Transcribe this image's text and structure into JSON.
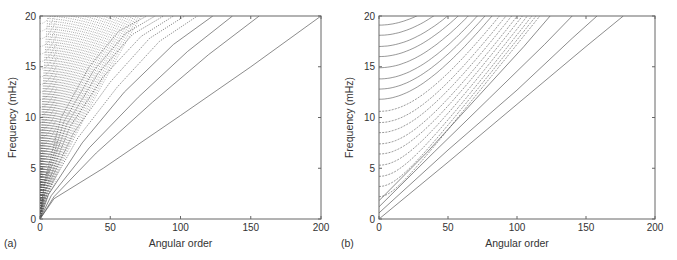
{
  "chart_data": [
    {
      "panel": "(a)",
      "type": "line",
      "title": "",
      "xlabel": "Angular order",
      "ylabel": "Frequency (mHz)",
      "xlim": [
        0,
        200
      ],
      "ylim": [
        0,
        20
      ],
      "xticks": [
        0,
        50,
        100,
        150,
        200
      ],
      "yticks": [
        0,
        5,
        10,
        15,
        20
      ],
      "grid": false,
      "legend": null,
      "description": "Dispersion branches (frequency vs angular order) for a spherical model; dense dotted branches fan out from the origin, fundamental branch reaches (200, 20)",
      "series": [
        {
          "name": "branch-0",
          "x": [
            0,
            10,
            45,
            100,
            150,
            200
          ],
          "y": [
            0,
            2,
            5,
            10.2,
            15,
            20
          ]
        },
        {
          "name": "branch-1",
          "x": [
            0,
            10,
            40,
            80,
            120,
            156
          ],
          "y": [
            0,
            2.2,
            6.5,
            11.5,
            16.2,
            20
          ]
        },
        {
          "name": "branch-2",
          "x": [
            0,
            8,
            35,
            70,
            105,
            137
          ],
          "y": [
            0,
            2.3,
            7,
            12,
            16.5,
            20
          ]
        },
        {
          "name": "branch-3",
          "x": [
            0,
            6,
            30,
            60,
            95,
            123
          ],
          "y": [
            0,
            2.4,
            7.5,
            12.5,
            17.2,
            20
          ]
        },
        {
          "name": "branch-4",
          "x": [
            0,
            5,
            27,
            55,
            85,
            112
          ],
          "y": [
            0,
            2.6,
            8,
            13,
            17.5,
            20
          ]
        },
        {
          "name": "branch-5",
          "x": [
            0,
            4,
            24,
            50,
            78,
            103
          ],
          "y": [
            0,
            2.8,
            8.5,
            13.5,
            17.8,
            20
          ]
        },
        {
          "name": "branch-6",
          "x": [
            0,
            4,
            21,
            45,
            72,
            95
          ],
          "y": [
            0,
            3,
            9,
            14,
            18,
            20
          ]
        },
        {
          "name": "branch-7",
          "x": [
            0,
            3,
            19,
            41,
            66,
            88
          ],
          "y": [
            0,
            3.2,
            9.3,
            14.3,
            18.2,
            20
          ]
        },
        {
          "name": "branch-8",
          "x": [
            0,
            3,
            17,
            38,
            61,
            82
          ],
          "y": [
            0,
            3.4,
            9.6,
            14.6,
            18.3,
            20
          ]
        },
        {
          "name": "branch-9",
          "x": [
            0,
            3,
            15,
            35,
            56,
            76
          ],
          "y": [
            0,
            3.6,
            10,
            15,
            18.5,
            20
          ]
        }
      ]
    },
    {
      "panel": "(b)",
      "type": "line",
      "title": "",
      "xlabel": "Angular order",
      "ylabel": "Frequency (mHz)",
      "xlim": [
        0,
        200
      ],
      "ylim": [
        0,
        20
      ],
      "xticks": [
        0,
        50,
        100,
        150,
        200
      ],
      "yticks": [
        0,
        5,
        10,
        15,
        20
      ],
      "grid": false,
      "legend": null,
      "description": "Dispersion branches for a simplified model; overtone branches start at ~1 mHz spacing on the frequency axis and curve upward to the right; fundamental branch reaches ~(177, 20)",
      "series": [
        {
          "name": "branch-0",
          "x": [
            0,
            50,
            100,
            150,
            177
          ],
          "y": [
            0,
            5.6,
            11.3,
            17,
            20
          ]
        },
        {
          "name": "branch-1",
          "x": [
            0,
            50,
            100,
            140,
            158
          ],
          "y": [
            0.6,
            6.8,
            12.7,
            17.8,
            20
          ]
        },
        {
          "name": "branch-2",
          "x": [
            0,
            40,
            80,
            120,
            140
          ],
          "y": [
            1.2,
            6.6,
            11.9,
            17.2,
            20
          ]
        },
        {
          "name": "branch-3",
          "x": [
            0,
            35,
            70,
            105,
            124
          ],
          "y": [
            1.8,
            6.6,
            11.8,
            17,
            20
          ]
        }
      ],
      "overtone_intercepts_mHz": [
        2.2,
        3.2,
        4.2,
        5.3,
        6.4,
        7.4,
        8.5,
        9.5,
        10.6,
        11.8,
        12.8,
        13.8,
        14.9,
        16.0,
        17.0,
        18.1,
        19.1
      ]
    }
  ],
  "panels": [
    {
      "tag": "(a)"
    },
    {
      "tag": "(b)"
    }
  ]
}
